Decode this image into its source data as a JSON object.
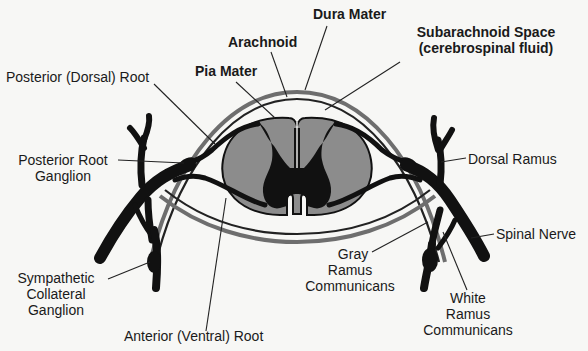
{
  "diagram": {
    "colors": {
      "background": "#f7f7f5",
      "nerve": "#111111",
      "gray_matter_outer": "#8c8c8c",
      "membrane_dark": "#333333",
      "membrane_gray": "#6e6e6e",
      "leader_line": "#222222",
      "text": "#1a1a1a"
    },
    "labels": {
      "dura_mater": "Dura Mater",
      "arachnoid": "Arachnoid",
      "pia_mater": "Pia Mater",
      "subarachnoid_line1": "Subarachnoid Space",
      "subarachnoid_line2": "(cerebrospinal fluid)",
      "posterior_dorsal_root": "Posterior (Dorsal) Root",
      "posterior_root_ganglion_line1": "Posterior Root",
      "posterior_root_ganglion_line2": "Ganglion",
      "dorsal_ramus": "Dorsal Ramus",
      "spinal_nerve": "Spinal Nerve",
      "sympathetic_line1": "Sympathetic",
      "sympathetic_line2": "Collateral",
      "sympathetic_line3": "Ganglion",
      "anterior_ventral_root": "Anterior (Ventral) Root",
      "gray_ramus_line1": "Gray",
      "gray_ramus_line2": "Ramus",
      "gray_ramus_line3": "Communicans",
      "white_ramus_line1": "White",
      "white_ramus_line2": "Ramus",
      "white_ramus_line3": "Communicans"
    }
  }
}
